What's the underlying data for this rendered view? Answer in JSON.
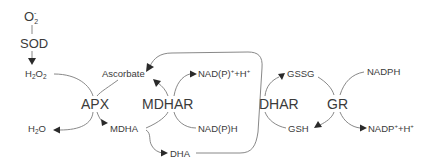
{
  "diagram": {
    "nodes": {
      "superoxide": {
        "base": "O",
        "sub": "2",
        "sup": "-"
      },
      "sod": "SOD",
      "h2o2": {
        "a": "H",
        "sub1": "2",
        "b": "O",
        "sub2": "2"
      },
      "ascorbate": "Ascorbate",
      "apx": "APX",
      "mdhar": "MDHAR",
      "dhar": "DHAR",
      "gr": "GR",
      "nadp_plus_h_top": {
        "a": "NAD(P)",
        "sup1": "+",
        "b": "+H",
        "sup2": "+"
      },
      "nadph_mid": "NAD(P)H",
      "gssg": "GSSG",
      "nadph": "NADPH",
      "gsh": "GSH",
      "nadp_plus_h_right": {
        "a": "NADP",
        "sup1": "+",
        "b": "+H",
        "sup2": "+"
      },
      "h2o": {
        "a": "H",
        "sub": "2",
        "b": "O"
      },
      "mdha": "MDHA",
      "dha": "DHA"
    },
    "colors": {
      "text": "#3a3a3a",
      "line": "#7a7a7a",
      "arrow": "#2a2a2a",
      "background": "#ffffff"
    }
  }
}
